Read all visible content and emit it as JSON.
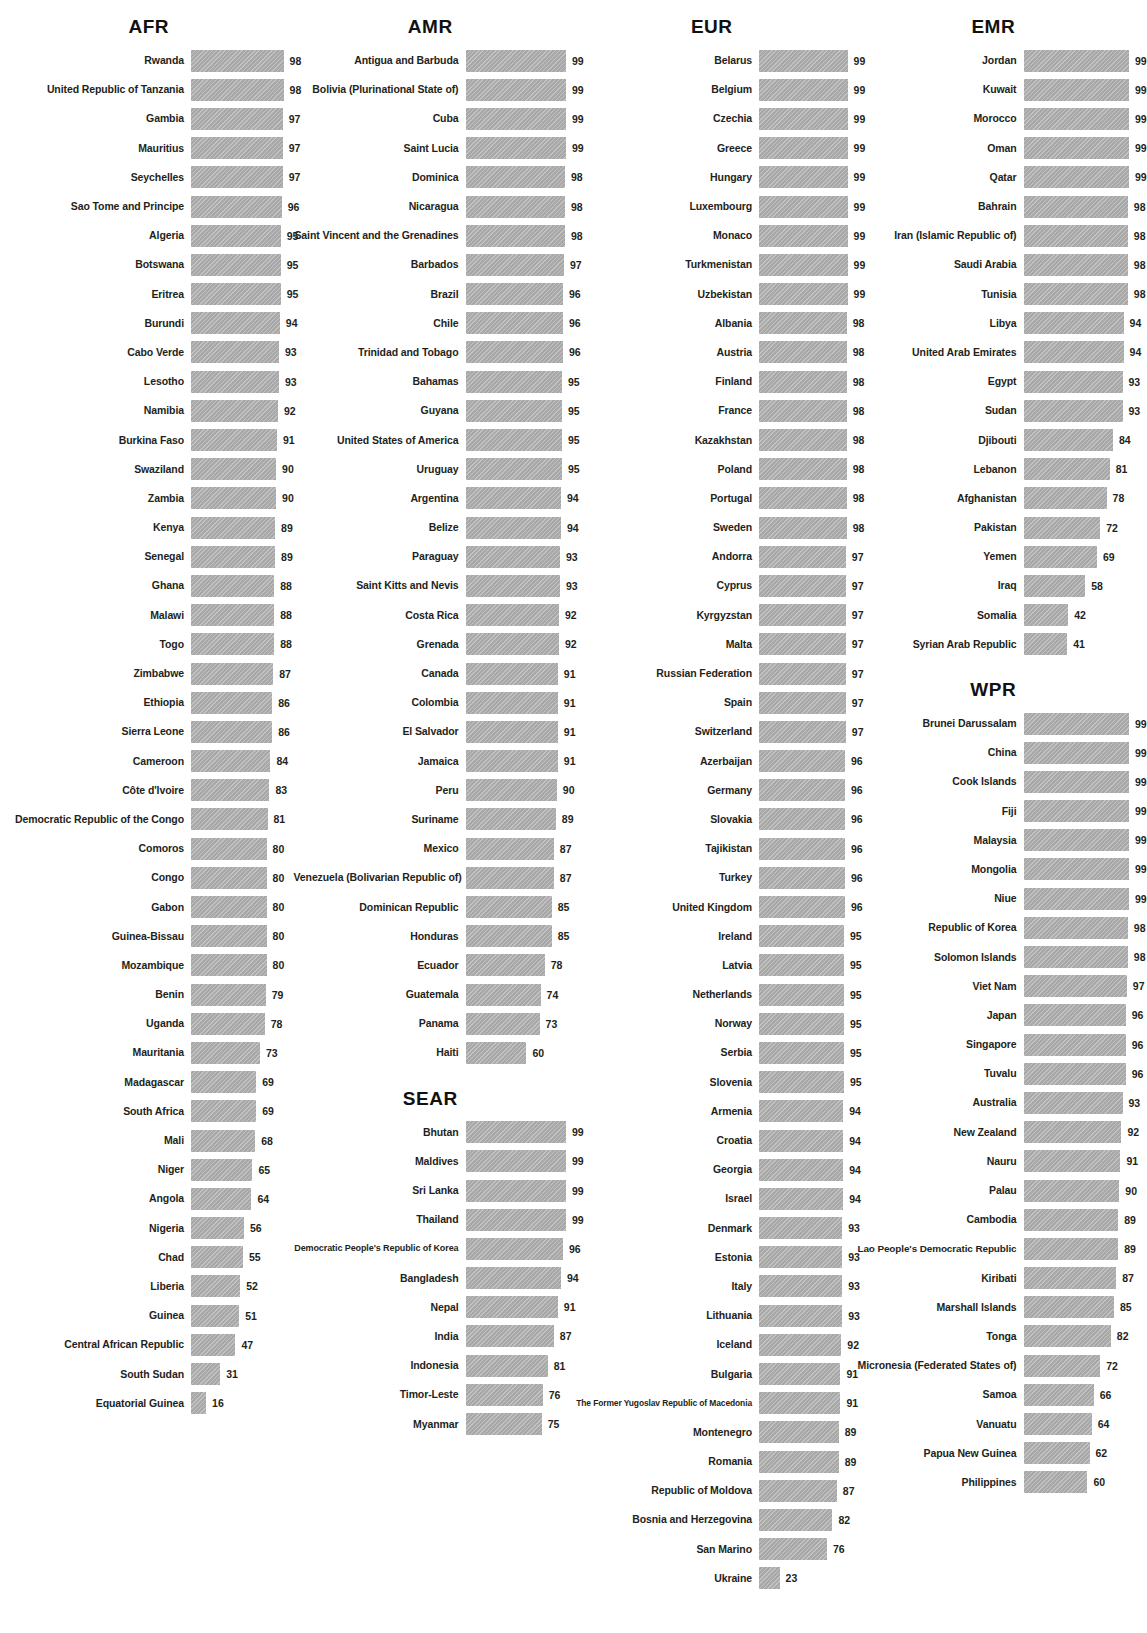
{
  "chart_data": {
    "type": "bar",
    "title": "",
    "xlabel": "",
    "ylabel": "",
    "xlim": [
      0,
      100
    ],
    "grid": false,
    "legend": "none",
    "value_suffix": "",
    "bar_color": "#a8a8a8",
    "groups": [
      {
        "name": "AFR",
        "column": 0,
        "categories": [
          "Rwanda",
          "United Republic of Tanzania",
          "Gambia",
          "Mauritius",
          "Seychelles",
          "Sao Tome and Principe",
          "Algeria",
          "Botswana",
          "Eritrea",
          "Burundi",
          "Cabo Verde",
          "Lesotho",
          "Namibia",
          "Burkina Faso",
          "Swaziland",
          "Zambia",
          "Kenya",
          "Senegal",
          "Ghana",
          "Malawi",
          "Togo",
          "Zimbabwe",
          "Ethiopia",
          "Sierra Leone",
          "Cameroon",
          "Côte d'Ivoire",
          "Democratic Republic of the Congo",
          "Comoros",
          "Congo",
          "Gabon",
          "Guinea-Bissau",
          "Mozambique",
          "Benin",
          "Uganda",
          "Mauritania",
          "Madagascar",
          "South Africa",
          "Mali",
          "Niger",
          "Angola",
          "Nigeria",
          "Chad",
          "Liberia",
          "Guinea",
          "Central African Republic",
          "South Sudan",
          "Equatorial Guinea"
        ],
        "values": [
          98,
          98,
          97,
          97,
          97,
          96,
          95,
          95,
          95,
          94,
          93,
          93,
          92,
          91,
          90,
          90,
          89,
          89,
          88,
          88,
          88,
          87,
          86,
          86,
          84,
          83,
          81,
          80,
          80,
          80,
          80,
          80,
          79,
          78,
          73,
          69,
          69,
          68,
          65,
          64,
          56,
          55,
          52,
          51,
          47,
          31,
          16
        ]
      },
      {
        "name": "AMR",
        "column": 1,
        "categories": [
          "Antigua and Barbuda",
          "Bolivia (Plurinational State of)",
          "Cuba",
          "Saint Lucia",
          "Dominica",
          "Nicaragua",
          "Saint Vincent and the Grenadines",
          "Barbados",
          "Brazil",
          "Chile",
          "Trinidad and Tobago",
          "Bahamas",
          "Guyana",
          "United States of America",
          "Uruguay",
          "Argentina",
          "Belize",
          "Paraguay",
          "Saint Kitts and Nevis",
          "Costa Rica",
          "Grenada",
          "Canada",
          "Colombia",
          "El Salvador",
          "Jamaica",
          "Peru",
          "Suriname",
          "Mexico",
          "Venezuela (Bolivarian Republic of)",
          "Dominican Republic",
          "Honduras",
          "Ecuador",
          "Guatemala",
          "Panama",
          "Haiti"
        ],
        "values": [
          99,
          99,
          99,
          99,
          98,
          98,
          98,
          97,
          96,
          96,
          96,
          95,
          95,
          95,
          95,
          94,
          94,
          93,
          93,
          92,
          92,
          91,
          91,
          91,
          91,
          90,
          89,
          87,
          87,
          85,
          85,
          78,
          74,
          73,
          60
        ]
      },
      {
        "name": "SEAR",
        "column": 1,
        "categories": [
          "Bhutan",
          "Maldives",
          "Sri Lanka",
          "Thailand",
          "Democratic People's Republic of Korea",
          "Bangladesh",
          "Nepal",
          "India",
          "Indonesia",
          "Timor-Leste",
          "Myanmar"
        ],
        "values": [
          99,
          99,
          99,
          99,
          96,
          94,
          91,
          87,
          81,
          76,
          75
        ]
      },
      {
        "name": "EUR",
        "column": 2,
        "categories": [
          "Belarus",
          "Belgium",
          "Czechia",
          "Greece",
          "Hungary",
          "Luxembourg",
          "Monaco",
          "Turkmenistan",
          "Uzbekistan",
          "Albania",
          "Austria",
          "Finland",
          "France",
          "Kazakhstan",
          "Poland",
          "Portugal",
          "Sweden",
          "Andorra",
          "Cyprus",
          "Kyrgyzstan",
          "Malta",
          "Russian Federation",
          "Spain",
          "Switzerland",
          "Azerbaijan",
          "Germany",
          "Slovakia",
          "Tajikistan",
          "Turkey",
          "United Kingdom",
          "Ireland",
          "Latvia",
          "Netherlands",
          "Norway",
          "Serbia",
          "Slovenia",
          "Armenia",
          "Croatia",
          "Georgia",
          "Israel",
          "Denmark",
          "Estonia",
          "Italy",
          "Lithuania",
          "Iceland",
          "Bulgaria",
          "The Former Yugoslav Republic of Macedonia",
          "Montenegro",
          "Romania",
          "Republic of Moldova",
          "Bosnia and Herzegovina",
          "San Marino",
          "Ukraine"
        ],
        "values": [
          99,
          99,
          99,
          99,
          99,
          99,
          99,
          99,
          99,
          98,
          98,
          98,
          98,
          98,
          98,
          98,
          98,
          97,
          97,
          97,
          97,
          97,
          97,
          97,
          96,
          96,
          96,
          96,
          96,
          96,
          95,
          95,
          95,
          95,
          95,
          95,
          94,
          94,
          94,
          94,
          93,
          93,
          93,
          93,
          92,
          91,
          91,
          89,
          89,
          87,
          82,
          76,
          23
        ]
      },
      {
        "name": "EMR",
        "column": 3,
        "categories": [
          "Jordan",
          "Kuwait",
          "Morocco",
          "Oman",
          "Qatar",
          "Bahrain",
          "Iran (Islamic Republic of)",
          "Saudi Arabia",
          "Tunisia",
          "Libya",
          "United Arab Emirates",
          "Egypt",
          "Sudan",
          "Djibouti",
          "Lebanon",
          "Afghanistan",
          "Pakistan",
          "Yemen",
          "Iraq",
          "Somalia",
          "Syrian Arab Republic"
        ],
        "values": [
          99,
          99,
          99,
          99,
          99,
          98,
          98,
          98,
          98,
          94,
          94,
          93,
          93,
          84,
          81,
          78,
          72,
          69,
          58,
          42,
          41
        ]
      },
      {
        "name": "WPR",
        "column": 3,
        "categories": [
          "Brunei Darussalam",
          "China",
          "Cook Islands",
          "Fiji",
          "Malaysia",
          "Mongolia",
          "Niue",
          "Republic of Korea",
          "Solomon Islands",
          "Viet Nam",
          "Japan",
          "Singapore",
          "Tuvalu",
          "Australia",
          "New Zealand",
          "Nauru",
          "Palau",
          "Cambodia",
          "Lao People's Democratic Republic",
          "Kiribati",
          "Marshall Islands",
          "Tonga",
          "Micronesia (Federated States of)",
          "Samoa",
          "Vanuatu",
          "Papua New Guinea",
          "Philippines"
        ],
        "values": [
          99,
          99,
          99,
          99,
          99,
          99,
          99,
          98,
          98,
          97,
          96,
          96,
          96,
          93,
          92,
          91,
          90,
          89,
          89,
          87,
          85,
          82,
          72,
          66,
          64,
          62,
          60
        ]
      }
    ]
  }
}
